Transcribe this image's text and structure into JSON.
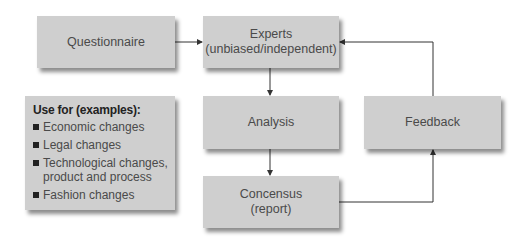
{
  "diagram": {
    "nodes": {
      "questionnaire": {
        "label": "Questionnaire"
      },
      "experts": {
        "line1": "Experts",
        "line2": "(unbiased/independent)"
      },
      "analysis": {
        "label": "Analysis"
      },
      "feedback": {
        "label": "Feedback"
      },
      "consensus": {
        "line1": "Concensus",
        "line2": "(report)"
      }
    },
    "use_for": {
      "heading": "Use for (examples):",
      "items": [
        {
          "label": "Economic changes"
        },
        {
          "label": "Legal changes"
        },
        {
          "label": "Technological changes, product and process"
        },
        {
          "label": "Fashion changes"
        }
      ]
    },
    "edges": [
      {
        "from": "Questionnaire",
        "to": "Experts"
      },
      {
        "from": "Experts",
        "to": "Analysis"
      },
      {
        "from": "Analysis",
        "to": "Concensus"
      },
      {
        "from": "Concensus",
        "to": "Feedback"
      },
      {
        "from": "Feedback",
        "to": "Experts"
      }
    ],
    "colors": {
      "box": "#cfcfcf",
      "text": "#4a4a4a",
      "line": "#333333"
    }
  }
}
